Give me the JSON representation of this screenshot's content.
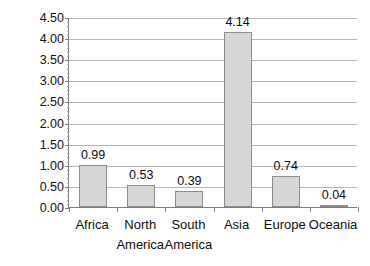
{
  "chart_data": {
    "type": "bar",
    "title": "",
    "subtitle": "",
    "xlabel": "",
    "ylabel": "Billions",
    "categories": [
      "Africa",
      "North America",
      "South America",
      "Asia",
      "Europe",
      "Oceania"
    ],
    "values": [
      0.99,
      0.53,
      0.39,
      4.14,
      0.74,
      0.04
    ],
    "data_labels": [
      "0.99",
      "0.53",
      "0.39",
      "4.14",
      "0.74",
      "0.04"
    ],
    "ylim": [
      0.0,
      4.5
    ],
    "ytick_step": 0.5,
    "ytick_labels": [
      "4.50",
      "4.00",
      "3.50",
      "3.00",
      "2.50",
      "2.00",
      "1.50",
      "1.00",
      "0.50",
      "0.00"
    ],
    "ytick_values": [
      4.5,
      4.0,
      3.5,
      3.0,
      2.5,
      2.0,
      1.5,
      1.0,
      0.5,
      0.0
    ],
    "grid": "horizontal",
    "legend": "none",
    "minor_ticks_per_interval": 5,
    "colors": {
      "bar_fill": "#d6d6d6",
      "bar_border": "#8d8d8d",
      "gridline": "#b6b6b6",
      "axis": "#7d7d7d",
      "text": "#0d0d0d",
      "background": "#ffffff"
    }
  }
}
